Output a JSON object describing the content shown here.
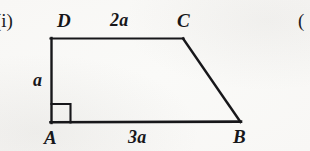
{
  "figure": {
    "enumeration": "(i)",
    "next_enumeration": "(",
    "shape_name": "trapezoid-abcd",
    "stroke_color": "#17171a",
    "background_color": "#fdfdfc",
    "vertices": {
      "a": {
        "label": "A",
        "x": 51,
        "y": 123
      },
      "b": {
        "label": "B",
        "x": 240,
        "y": 122
      },
      "c": {
        "label": "C",
        "x": 183,
        "y": 38
      },
      "d": {
        "label": "D",
        "x": 51,
        "y": 38
      }
    },
    "sides": {
      "dc": {
        "label": "2a",
        "from": "D",
        "to": "C"
      },
      "ab": {
        "label": "3a",
        "from": "A",
        "to": "B"
      },
      "ad": {
        "label": "a",
        "from": "A",
        "to": "D"
      },
      "cb": {
        "label": "",
        "from": "C",
        "to": "B"
      }
    },
    "right_angle": {
      "at_vertex": "A",
      "marker": "right-angle-square",
      "size": 19
    }
  }
}
